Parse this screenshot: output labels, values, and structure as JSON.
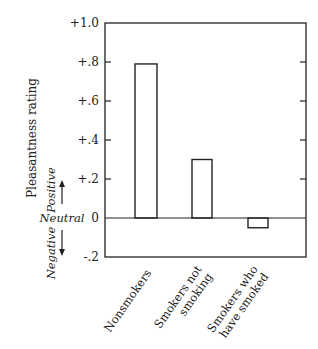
{
  "chart_data": {
    "type": "bar",
    "title": "",
    "xlabel": "",
    "ylabel": "Pleasantness rating",
    "ylim": [
      -0.2,
      1.0
    ],
    "yticks": [
      -0.2,
      0,
      0.2,
      0.4,
      0.6,
      0.8,
      1.0
    ],
    "ytick_labels": [
      "-.2",
      "0",
      "+.2",
      "+.4",
      "+.6",
      "+.8",
      "+1.0"
    ],
    "categories": [
      [
        "Nonsmokers"
      ],
      [
        "Smokers not",
        "smoking"
      ],
      [
        "Smokers who",
        "have smoked"
      ]
    ],
    "values": [
      0.79,
      0.3,
      -0.05
    ],
    "grid": false,
    "annotations": {
      "positive": "Positive",
      "neutral": "Neutral",
      "negative": "Negative"
    }
  }
}
